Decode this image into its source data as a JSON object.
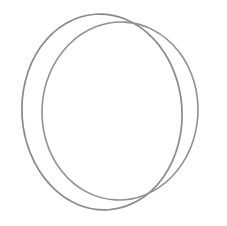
{
  "figure": {
    "background_color": "#ffffff",
    "width": 227,
    "height": 226,
    "shape_count": "2",
    "shape_type": "ellipse",
    "stroke_color": "#8a8a8a",
    "stroke_color_secondary": "#909090",
    "stroke_width": "1.6",
    "fill": "none"
  },
  "shapes": [
    {
      "id": "ellipse-outer",
      "label": "Outer ellipse",
      "center_x": 102,
      "center_y": 112,
      "radius_x": 80,
      "radius_y": 98,
      "rotation_deg": -4,
      "bounds": {
        "left": 22,
        "top": 14,
        "right": 182,
        "bottom": 210
      },
      "stroke_color": "#8a8a8a",
      "stroke_width": 1.7
    },
    {
      "id": "ellipse-inner",
      "label": "Inner ellipse",
      "center_x": 120,
      "center_y": 111,
      "radius_x": 78,
      "radius_y": 89,
      "rotation_deg": 3,
      "bounds": {
        "left": 42,
        "top": 22,
        "right": 198,
        "bottom": 200
      },
      "stroke_color": "#909090",
      "stroke_width": 1.6
    }
  ],
  "annotations": {
    "nearest_contact_top_x": 100,
    "nearest_contact_bottom_x": 118,
    "max_gap_left_px": 20,
    "max_gap_right_px": 16
  }
}
